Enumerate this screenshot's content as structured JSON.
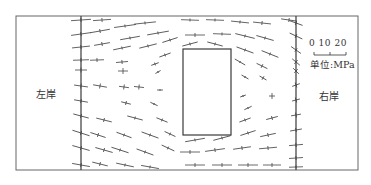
{
  "figure": {
    "labels": {
      "left_bank": "左岸",
      "right_bank": "右岸"
    },
    "scale": {
      "ticks": "0 10 20",
      "tick_values": [
        0,
        10,
        20
      ],
      "unit": "单位:MPa"
    },
    "colors": {
      "line": "#3a3a3a",
      "frame": "#666666",
      "stress": "#444444",
      "background": "#ffffff"
    },
    "frame": {
      "x": 16,
      "y": 16,
      "w": 342,
      "h": 154
    },
    "boundaries": [
      {
        "x1": 81,
        "y1": 16,
        "x2": 81,
        "y2": 170
      },
      {
        "x1": 296,
        "y1": 16,
        "x2": 296,
        "y2": 170
      }
    ],
    "opening": {
      "x": 183,
      "y": 49,
      "w": 48,
      "h": 86
    },
    "stress_crosses": [
      {
        "x": 81,
        "y": 20,
        "a": -4,
        "l1": 20,
        "l2": 4
      },
      {
        "x": 102,
        "y": 20,
        "a": -4,
        "l1": 18,
        "l2": 4
      },
      {
        "x": 81,
        "y": 34,
        "a": -8,
        "l1": 20,
        "l2": 4
      },
      {
        "x": 100,
        "y": 31,
        "a": -10,
        "l1": 20,
        "l2": 4
      },
      {
        "x": 81,
        "y": 47,
        "a": -6,
        "l1": 18,
        "l2": 4
      },
      {
        "x": 102,
        "y": 44,
        "a": -10,
        "l1": 16,
        "l2": 4
      },
      {
        "x": 81,
        "y": 60,
        "a": -2,
        "l1": 16,
        "l2": 4
      },
      {
        "x": 97,
        "y": 60,
        "a": -2,
        "l1": 14,
        "l2": 4
      },
      {
        "x": 81,
        "y": 70,
        "a": 0,
        "l1": 12,
        "l2": 5
      },
      {
        "x": 81,
        "y": 86,
        "a": 8,
        "l1": 14,
        "l2": 5
      },
      {
        "x": 100,
        "y": 86,
        "a": 10,
        "l1": 14,
        "l2": 5
      },
      {
        "x": 81,
        "y": 101,
        "a": 10,
        "l1": 14,
        "l2": 4
      },
      {
        "x": 81,
        "y": 116,
        "a": 15,
        "l1": 16,
        "l2": 4
      },
      {
        "x": 104,
        "y": 120,
        "a": 14,
        "l1": 16,
        "l2": 4
      },
      {
        "x": 81,
        "y": 133,
        "a": 18,
        "l1": 18,
        "l2": 4
      },
      {
        "x": 98,
        "y": 135,
        "a": 18,
        "l1": 16,
        "l2": 4
      },
      {
        "x": 81,
        "y": 148,
        "a": 16,
        "l1": 18,
        "l2": 4
      },
      {
        "x": 104,
        "y": 150,
        "a": 16,
        "l1": 18,
        "l2": 4
      },
      {
        "x": 81,
        "y": 165,
        "a": 10,
        "l1": 18,
        "l2": 4
      },
      {
        "x": 100,
        "y": 164,
        "a": 14,
        "l1": 16,
        "l2": 4
      },
      {
        "x": 125,
        "y": 26,
        "a": -8,
        "l1": 22,
        "l2": 3
      },
      {
        "x": 145,
        "y": 23,
        "a": -6,
        "l1": 22,
        "l2": 3
      },
      {
        "x": 158,
        "y": 33,
        "a": -10,
        "l1": 22,
        "l2": 3
      },
      {
        "x": 130,
        "y": 38,
        "a": -10,
        "l1": 20,
        "l2": 3
      },
      {
        "x": 122,
        "y": 48,
        "a": -12,
        "l1": 18,
        "l2": 3
      },
      {
        "x": 148,
        "y": 46,
        "a": -14,
        "l1": 18,
        "l2": 3
      },
      {
        "x": 170,
        "y": 40,
        "a": -18,
        "l1": 16,
        "l2": 3
      },
      {
        "x": 165,
        "y": 55,
        "a": -20,
        "l1": 12,
        "l2": 3
      },
      {
        "x": 122,
        "y": 62,
        "a": -5,
        "l1": 12,
        "l2": 4
      },
      {
        "x": 155,
        "y": 64,
        "a": -20,
        "l1": 8,
        "l2": 3
      },
      {
        "x": 123,
        "y": 71,
        "a": 0,
        "l1": 10,
        "l2": 6
      },
      {
        "x": 158,
        "y": 72,
        "a": -30,
        "l1": 6,
        "l2": 2
      },
      {
        "x": 124,
        "y": 87,
        "a": 8,
        "l1": 10,
        "l2": 5
      },
      {
        "x": 139,
        "y": 87,
        "a": 6,
        "l1": 10,
        "l2": 5
      },
      {
        "x": 160,
        "y": 90,
        "a": 0,
        "l1": 6,
        "l2": 2
      },
      {
        "x": 126,
        "y": 103,
        "a": 14,
        "l1": 10,
        "l2": 4
      },
      {
        "x": 154,
        "y": 104,
        "a": 25,
        "l1": 8,
        "l2": 2
      },
      {
        "x": 135,
        "y": 118,
        "a": 15,
        "l1": 16,
        "l2": 3
      },
      {
        "x": 162,
        "y": 120,
        "a": 22,
        "l1": 12,
        "l2": 3
      },
      {
        "x": 124,
        "y": 135,
        "a": 20,
        "l1": 16,
        "l2": 3
      },
      {
        "x": 150,
        "y": 135,
        "a": 20,
        "l1": 18,
        "l2": 3
      },
      {
        "x": 170,
        "y": 134,
        "a": 25,
        "l1": 12,
        "l2": 3
      },
      {
        "x": 120,
        "y": 150,
        "a": 18,
        "l1": 18,
        "l2": 3
      },
      {
        "x": 145,
        "y": 152,
        "a": 20,
        "l1": 18,
        "l2": 3
      },
      {
        "x": 168,
        "y": 148,
        "a": 25,
        "l1": 14,
        "l2": 3
      },
      {
        "x": 125,
        "y": 165,
        "a": 12,
        "l1": 18,
        "l2": 3
      },
      {
        "x": 150,
        "y": 167,
        "a": 10,
        "l1": 18,
        "l2": 3
      },
      {
        "x": 190,
        "y": 20,
        "a": 2,
        "l1": 18,
        "l2": 3
      },
      {
        "x": 215,
        "y": 20,
        "a": 2,
        "l1": 18,
        "l2": 3
      },
      {
        "x": 195,
        "y": 35,
        "a": 0,
        "l1": 20,
        "l2": 4
      },
      {
        "x": 222,
        "y": 34,
        "a": 2,
        "l1": 18,
        "l2": 3
      },
      {
        "x": 190,
        "y": 44,
        "a": -15,
        "l1": 16,
        "l2": 3
      },
      {
        "x": 215,
        "y": 44,
        "a": 15,
        "l1": 16,
        "l2": 3
      },
      {
        "x": 240,
        "y": 22,
        "a": 6,
        "l1": 18,
        "l2": 3
      },
      {
        "x": 262,
        "y": 23,
        "a": 6,
        "l1": 18,
        "l2": 4
      },
      {
        "x": 245,
        "y": 36,
        "a": 14,
        "l1": 20,
        "l2": 3
      },
      {
        "x": 265,
        "y": 38,
        "a": 16,
        "l1": 18,
        "l2": 3
      },
      {
        "x": 245,
        "y": 50,
        "a": 20,
        "l1": 18,
        "l2": 3
      },
      {
        "x": 270,
        "y": 54,
        "a": 22,
        "l1": 18,
        "l2": 3
      },
      {
        "x": 240,
        "y": 62,
        "a": 30,
        "l1": 12,
        "l2": 2
      },
      {
        "x": 262,
        "y": 66,
        "a": 26,
        "l1": 12,
        "l2": 4
      },
      {
        "x": 245,
        "y": 77,
        "a": 30,
        "l1": 8,
        "l2": 2
      },
      {
        "x": 263,
        "y": 78,
        "a": 30,
        "l1": 8,
        "l2": 4
      },
      {
        "x": 243,
        "y": 96,
        "a": -20,
        "l1": 6,
        "l2": 2
      },
      {
        "x": 272,
        "y": 96,
        "a": 0,
        "l1": 6,
        "l2": 6
      },
      {
        "x": 248,
        "y": 108,
        "a": -25,
        "l1": 8,
        "l2": 2
      },
      {
        "x": 245,
        "y": 120,
        "a": -20,
        "l1": 12,
        "l2": 3
      },
      {
        "x": 272,
        "y": 118,
        "a": -15,
        "l1": 12,
        "l2": 4
      },
      {
        "x": 248,
        "y": 133,
        "a": -18,
        "l1": 16,
        "l2": 3
      },
      {
        "x": 268,
        "y": 135,
        "a": -12,
        "l1": 16,
        "l2": 4
      },
      {
        "x": 195,
        "y": 140,
        "a": -10,
        "l1": 20,
        "l2": 3
      },
      {
        "x": 222,
        "y": 138,
        "a": -15,
        "l1": 18,
        "l2": 3
      },
      {
        "x": 190,
        "y": 152,
        "a": 0,
        "l1": 20,
        "l2": 4
      },
      {
        "x": 215,
        "y": 150,
        "a": -8,
        "l1": 20,
        "l2": 4
      },
      {
        "x": 242,
        "y": 148,
        "a": -8,
        "l1": 18,
        "l2": 4
      },
      {
        "x": 268,
        "y": 148,
        "a": -5,
        "l1": 18,
        "l2": 4
      },
      {
        "x": 195,
        "y": 165,
        "a": 0,
        "l1": 20,
        "l2": 4
      },
      {
        "x": 222,
        "y": 165,
        "a": 0,
        "l1": 20,
        "l2": 4
      },
      {
        "x": 248,
        "y": 165,
        "a": 0,
        "l1": 20,
        "l2": 4
      },
      {
        "x": 272,
        "y": 165,
        "a": 0,
        "l1": 18,
        "l2": 4
      },
      {
        "x": 289,
        "y": 20,
        "a": 8,
        "l1": 16,
        "l2": 4
      },
      {
        "x": 296,
        "y": 23,
        "a": 20,
        "l1": 14,
        "l2": 4
      },
      {
        "x": 296,
        "y": 36,
        "a": 25,
        "l1": 14,
        "l2": 4
      },
      {
        "x": 296,
        "y": 50,
        "a": 35,
        "l1": 12,
        "l2": 4
      },
      {
        "x": 296,
        "y": 62,
        "a": 40,
        "l1": 10,
        "l2": 5
      },
      {
        "x": 296,
        "y": 71,
        "a": 45,
        "l1": 8,
        "l2": 5
      },
      {
        "x": 296,
        "y": 85,
        "a": -20,
        "l1": 8,
        "l2": 5
      },
      {
        "x": 296,
        "y": 100,
        "a": -15,
        "l1": 8,
        "l2": 5
      },
      {
        "x": 296,
        "y": 115,
        "a": -10,
        "l1": 10,
        "l2": 5
      },
      {
        "x": 296,
        "y": 130,
        "a": -10,
        "l1": 12,
        "l2": 4
      },
      {
        "x": 296,
        "y": 145,
        "a": -5,
        "l1": 14,
        "l2": 4
      },
      {
        "x": 296,
        "y": 158,
        "a": -4,
        "l1": 14,
        "l2": 4
      },
      {
        "x": 296,
        "y": 167,
        "a": -2,
        "l1": 14,
        "l2": 3
      }
    ]
  }
}
